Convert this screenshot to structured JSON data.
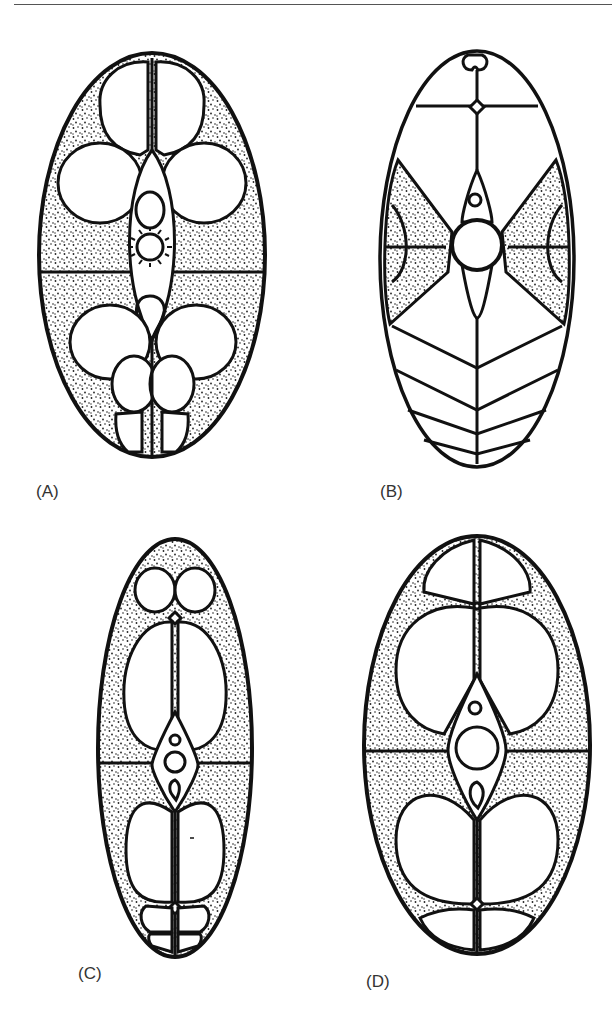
{
  "figure": {
    "panels": [
      {
        "id": "A",
        "label": "(A)"
      },
      {
        "id": "B",
        "label": "(B)"
      },
      {
        "id": "C",
        "label": "(C)"
      },
      {
        "id": "D",
        "label": "(D)"
      }
    ]
  },
  "colors": {
    "line": "#111111",
    "stipple": "#222222",
    "background": "#ffffff"
  }
}
